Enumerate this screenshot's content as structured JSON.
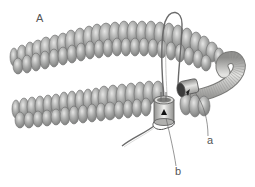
{
  "figure": {
    "panel_label": "A",
    "callouts": [
      {
        "id": "a",
        "text": "a",
        "target": "crimp tube covered with wire guard"
      },
      {
        "id": "b",
        "text": "b",
        "target": "crimp bead / cord end"
      }
    ],
    "colors": {
      "bead_fill": "#a9aaa9",
      "bead_stroke": "#6e6f6e",
      "tube_fill": "#c9c9c7",
      "line": "#6a6a6a",
      "label": "#555555"
    }
  }
}
